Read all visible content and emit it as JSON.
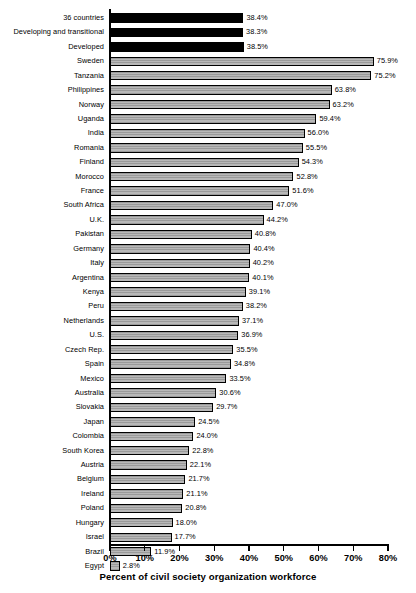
{
  "chart_data": {
    "type": "bar",
    "orientation": "horizontal",
    "title": "",
    "xlabel": "Percent of civil society organization workforce",
    "ylabel": "",
    "xlim": [
      0,
      80
    ],
    "xticks": [
      "0%",
      "10%",
      "20%",
      "30%",
      "40%",
      "50%",
      "60%",
      "70%",
      "80%"
    ],
    "xtick_values": [
      0,
      10,
      20,
      30,
      40,
      50,
      60,
      70,
      80
    ],
    "grid": false,
    "legend": null,
    "value_suffix": "%",
    "series_colors": {
      "aggregate": "#000000",
      "country": "#a9a9a9"
    },
    "categories": [
      "36 countries",
      "Developing and transitional",
      "Developed",
      "Sweden",
      "Tanzania",
      "Philippines",
      "Norway",
      "Uganda",
      "India",
      "Romania",
      "Finland",
      "Morocco",
      "France",
      "South Africa",
      "U.K.",
      "Pakistan",
      "Germany",
      "Italy",
      "Argentina",
      "Kenya",
      "Peru",
      "Netherlands",
      "U.S.",
      "Czech Rep.",
      "Spain",
      "Mexico",
      "Australia",
      "Slovakia",
      "Japan",
      "Colombia",
      "South Korea",
      "Austria",
      "Belgium",
      "Ireland",
      "Poland",
      "Hungary",
      "Israel",
      "Brazil",
      "Egypt"
    ],
    "values": [
      38.4,
      38.3,
      38.5,
      75.9,
      75.2,
      63.8,
      63.2,
      59.4,
      56.0,
      55.5,
      54.3,
      52.8,
      51.6,
      47.0,
      44.2,
      40.8,
      40.4,
      40.2,
      40.1,
      39.1,
      38.2,
      37.1,
      36.9,
      35.5,
      34.8,
      33.5,
      30.6,
      29.7,
      24.5,
      24.0,
      22.8,
      22.1,
      21.7,
      21.1,
      20.8,
      18.0,
      17.7,
      11.9,
      2.8
    ],
    "value_labels": [
      "38.4%",
      "38.3%",
      "38.5%",
      "75.9%",
      "75.2%",
      "63.8%",
      "63.2%",
      "59.4%",
      "56.0%",
      "55.5%",
      "54.3%",
      "52.8%",
      "51.6%",
      "47.0%",
      "44.2%",
      "40.8%",
      "40.4%",
      "40.2%",
      "40.1%",
      "39.1%",
      "38.2%",
      "37.1%",
      "36.9%",
      "35.5%",
      "34.8%",
      "33.5%",
      "30.6%",
      "29.7%",
      "24.5%",
      "24.0%",
      "22.8%",
      "22.1%",
      "21.7%",
      "21.1%",
      "20.8%",
      "18.0%",
      "17.7%",
      "11.9%",
      "2.8%"
    ],
    "bar_styles": [
      "aggregate",
      "aggregate",
      "aggregate",
      "country",
      "country",
      "country",
      "country",
      "country",
      "country",
      "country",
      "country",
      "country",
      "country",
      "country",
      "country",
      "country",
      "country",
      "country",
      "country",
      "country",
      "country",
      "country",
      "country",
      "country",
      "country",
      "country",
      "country",
      "country",
      "country",
      "country",
      "country",
      "country",
      "country",
      "country",
      "country",
      "country",
      "country",
      "country",
      "country"
    ]
  }
}
